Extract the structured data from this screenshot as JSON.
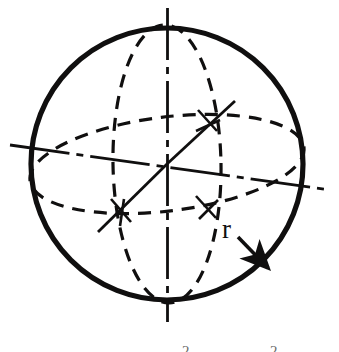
{
  "figure": {
    "kind": "technical-line-drawing",
    "background_color": "#ffffff",
    "ink_color": "#100f0f",
    "width": 339,
    "height": 352,
    "labels": {
      "radius": "r"
    },
    "partial_text_at_bottom_edge": {
      "note_visible_fragments": [
        "2",
        "2"
      ],
      "glyph_1": "2",
      "glyph_2": "2"
    },
    "elements": {
      "outline_circle": "sphere-outline",
      "vertical_ellipse": "meridian-great-circle",
      "horizontal_ellipse": "equator-great-circle",
      "vertical_axis": "polar-axis",
      "horizontal_axis": "equatorial-axis",
      "diagonal_axis_upper_right": "oblique-axis-ne",
      "diagonal_axis_lower_left": "oblique-axis-sw",
      "radius_leader": "radius-arrow"
    },
    "geometry": {
      "center_x": 167,
      "center_y": 164,
      "radius_px": 139,
      "outline_stroke_width": 5,
      "dashed_stroke_width": 3.2,
      "axis_stroke_width": 2.6
    }
  }
}
